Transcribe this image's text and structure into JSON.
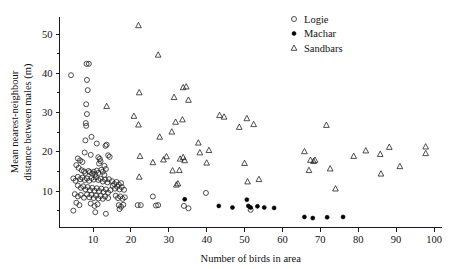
{
  "chart_data": {
    "type": "scatter",
    "title": "",
    "xlabel": "Number of birds in area",
    "ylabel": "Mean nearest-neighbour distance between males (m)",
    "ylabel_line1": "Mean nearest-neighbour",
    "ylabel_line2": "distance between males (m)",
    "xlim": [
      2,
      103
    ],
    "ylim": [
      2.0,
      54.5
    ],
    "grid": false,
    "legend_position": "top-right",
    "x_major_ticks": [
      10,
      20,
      30,
      40,
      50,
      60,
      70,
      80,
      90,
      100
    ],
    "x_tick_labels": [
      "10",
      "20",
      "30",
      "40",
      "50",
      "60",
      "70",
      "80",
      "90",
      "100"
    ],
    "y_major_ticks": [
      10,
      20,
      30,
      40,
      50
    ],
    "y_tick_labels": [
      "10",
      "20",
      "30",
      "40",
      "50"
    ],
    "y_minor_ticks": [
      5,
      15,
      25,
      35,
      45
    ],
    "series": [
      {
        "name": "Logie",
        "marker": "open-circle",
        "color": "#222222",
        "points": [
          [
            4.2,
            39.5
          ],
          [
            8.3,
            42.4
          ],
          [
            8.9,
            42.4
          ],
          [
            8.4,
            38.3
          ],
          [
            8.6,
            35.7
          ],
          [
            8.2,
            32.1
          ],
          [
            8.4,
            29.6
          ],
          [
            8.1,
            27.3
          ],
          [
            8.2,
            26.6
          ],
          [
            9.6,
            23.8
          ],
          [
            8.0,
            22.9
          ],
          [
            11.0,
            22.1
          ],
          [
            13.6,
            21.8
          ],
          [
            13.3,
            21.5
          ],
          [
            7.8,
            19.8
          ],
          [
            6.0,
            18.3
          ],
          [
            6.6,
            17.8
          ],
          [
            7.2,
            17.4
          ],
          [
            9.4,
            19.2
          ],
          [
            11.4,
            18.6
          ],
          [
            11.8,
            18.2
          ],
          [
            12.0,
            17.6
          ],
          [
            11.6,
            17.0
          ],
          [
            14.0,
            19.1
          ],
          [
            14.4,
            18.7
          ],
          [
            13.0,
            16.4
          ],
          [
            13.4,
            15.6
          ],
          [
            5.6,
            16.6
          ],
          [
            6.2,
            15.9
          ],
          [
            7.0,
            15.3
          ],
          [
            7.6,
            15.0
          ],
          [
            8.0,
            14.6
          ],
          [
            8.8,
            15.1
          ],
          [
            9.2,
            14.8
          ],
          [
            9.8,
            14.4
          ],
          [
            10.2,
            14.9
          ],
          [
            10.6,
            14.2
          ],
          [
            11.0,
            15.2
          ],
          [
            11.4,
            14.6
          ],
          [
            12.2,
            15.4
          ],
          [
            12.6,
            14.9
          ],
          [
            13.0,
            14.1
          ],
          [
            4.8,
            13.2
          ],
          [
            5.4,
            12.6
          ],
          [
            6.0,
            13.6
          ],
          [
            6.6,
            13.0
          ],
          [
            7.2,
            13.4
          ],
          [
            7.8,
            12.8
          ],
          [
            8.4,
            13.2
          ],
          [
            9.0,
            12.6
          ],
          [
            9.6,
            13.3
          ],
          [
            10.2,
            12.9
          ],
          [
            10.8,
            13.5
          ],
          [
            11.4,
            12.8
          ],
          [
            12.0,
            13.1
          ],
          [
            12.6,
            12.4
          ],
          [
            13.2,
            12.9
          ],
          [
            13.8,
            12.2
          ],
          [
            14.2,
            13.0
          ],
          [
            15.0,
            12.5
          ],
          [
            15.6,
            11.8
          ],
          [
            16.2,
            12.3
          ],
          [
            16.8,
            11.6
          ],
          [
            17.4,
            12.0
          ],
          [
            6.0,
            11.4
          ],
          [
            6.8,
            10.8
          ],
          [
            7.4,
            11.2
          ],
          [
            8.0,
            10.4
          ],
          [
            8.6,
            11.0
          ],
          [
            9.2,
            10.2
          ],
          [
            9.8,
            10.8
          ],
          [
            10.4,
            10.1
          ],
          [
            11.0,
            10.7
          ],
          [
            11.6,
            10.0
          ],
          [
            12.2,
            10.6
          ],
          [
            12.8,
            9.8
          ],
          [
            13.4,
            10.4
          ],
          [
            14.0,
            9.6
          ],
          [
            14.6,
            10.2
          ],
          [
            15.2,
            11.3
          ],
          [
            15.8,
            10.6
          ],
          [
            16.4,
            11.1
          ],
          [
            17.0,
            10.4
          ],
          [
            17.6,
            11.0
          ],
          [
            18.2,
            10.3
          ],
          [
            5.2,
            9.2
          ],
          [
            6.0,
            8.6
          ],
          [
            6.8,
            9.0
          ],
          [
            7.6,
            8.3
          ],
          [
            8.4,
            9.1
          ],
          [
            9.0,
            8.4
          ],
          [
            9.6,
            9.0
          ],
          [
            10.2,
            8.2
          ],
          [
            10.8,
            8.8
          ],
          [
            11.4,
            8.1
          ],
          [
            12.0,
            8.7
          ],
          [
            12.6,
            8.0
          ],
          [
            13.2,
            8.6
          ],
          [
            14.0,
            8.2
          ],
          [
            16.0,
            8.8
          ],
          [
            16.6,
            8.2
          ],
          [
            17.2,
            8.6
          ],
          [
            17.8,
            8.0
          ],
          [
            18.4,
            8.4
          ],
          [
            5.6,
            7.0
          ],
          [
            6.4,
            6.4
          ],
          [
            9.4,
            6.8
          ],
          [
            10.4,
            6.2
          ],
          [
            11.2,
            6.6
          ],
          [
            16.8,
            6.4
          ],
          [
            17.4,
            6.0
          ],
          [
            18.0,
            6.5
          ],
          [
            4.8,
            5.0
          ],
          [
            10.6,
            4.6
          ],
          [
            13.4,
            4.2
          ],
          [
            17.0,
            5.4
          ],
          [
            21.8,
            6.4
          ],
          [
            22.6,
            6.4
          ],
          [
            25.8,
            8.6
          ],
          [
            26.6,
            6.3
          ],
          [
            27.2,
            6.4
          ],
          [
            34.0,
            6.2
          ],
          [
            39.8,
            9.5
          ],
          [
            35.2,
            5.6
          ],
          [
            51.6,
            5.2
          ]
        ]
      },
      {
        "name": "Machar",
        "marker": "filled-circle",
        "color": "#000000",
        "points": [
          [
            34.2,
            7.9
          ],
          [
            43.2,
            6.2
          ],
          [
            46.8,
            5.8
          ],
          [
            50.6,
            7.8
          ],
          [
            51.0,
            6.2
          ],
          [
            51.6,
            5.8
          ],
          [
            53.4,
            6.1
          ],
          [
            55.2,
            5.8
          ],
          [
            57.8,
            5.7
          ],
          [
            65.8,
            3.4
          ],
          [
            68.0,
            3.1
          ],
          [
            71.8,
            3.3
          ],
          [
            76.0,
            3.4
          ]
        ]
      },
      {
        "name": "Sandbars",
        "marker": "open-triangle",
        "color": "#222222",
        "points": [
          [
            22.0,
            52.2
          ],
          [
            27.2,
            44.7
          ],
          [
            33.8,
            36.4
          ],
          [
            34.6,
            36.6
          ],
          [
            22.2,
            35.1
          ],
          [
            31.4,
            33.9
          ],
          [
            35.2,
            33.2
          ],
          [
            13.6,
            31.6
          ],
          [
            20.8,
            29.1
          ],
          [
            43.4,
            29.3
          ],
          [
            44.6,
            28.9
          ],
          [
            50.6,
            28.5
          ],
          [
            33.6,
            28.2
          ],
          [
            31.8,
            27.6
          ],
          [
            22.0,
            26.9
          ],
          [
            48.6,
            26.3
          ],
          [
            52.4,
            27.0
          ],
          [
            71.6,
            26.8
          ],
          [
            30.8,
            25.1
          ],
          [
            27.6,
            23.8
          ],
          [
            37.8,
            22.3
          ],
          [
            40.6,
            20.4
          ],
          [
            38.2,
            19.8
          ],
          [
            65.8,
            20.1
          ],
          [
            82.0,
            20.3
          ],
          [
            88.2,
            21.2
          ],
          [
            97.8,
            21.3
          ],
          [
            97.8,
            19.6
          ],
          [
            78.8,
            18.9
          ],
          [
            85.8,
            19.4
          ],
          [
            22.4,
            18.9
          ],
          [
            25.8,
            17.3
          ],
          [
            28.6,
            18.0
          ],
          [
            29.4,
            18.8
          ],
          [
            33.0,
            18.2
          ],
          [
            33.8,
            18.6
          ],
          [
            34.2,
            17.8
          ],
          [
            40.0,
            17.2
          ],
          [
            50.0,
            17.1
          ],
          [
            67.4,
            17.9
          ],
          [
            68.2,
            17.6
          ],
          [
            68.6,
            17.9
          ],
          [
            91.0,
            16.3
          ],
          [
            67.0,
            15.3
          ],
          [
            72.6,
            15.7
          ],
          [
            31.0,
            15.2
          ],
          [
            32.8,
            15.3
          ],
          [
            22.2,
            13.6
          ],
          [
            86.0,
            14.4
          ],
          [
            50.8,
            12.4
          ],
          [
            53.8,
            13.0
          ],
          [
            32.0,
            11.6
          ],
          [
            32.4,
            11.9
          ],
          [
            74.0,
            10.6
          ]
        ]
      }
    ]
  },
  "legend": {
    "items": [
      {
        "label": "Logie",
        "marker": "open-circle"
      },
      {
        "label": "Machar",
        "marker": "filled-circle"
      },
      {
        "label": "Sandbars",
        "marker": "open-triangle"
      }
    ]
  }
}
